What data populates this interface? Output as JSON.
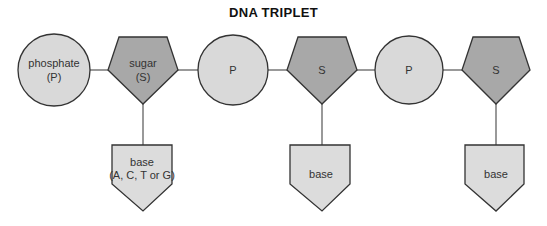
{
  "title": "DNA TRIPLET",
  "colors": {
    "phosphate_fill": "#d9d9d9",
    "sugar_fill": "#a8a8a8",
    "base_fill": "#dcdcdc",
    "stroke": "#333333",
    "connector": "#555555"
  },
  "nodes": [
    {
      "type": "phosphate",
      "line1": "phosphate",
      "line2": "(P)"
    },
    {
      "type": "sugar",
      "line1": "sugar",
      "line2": "(S)"
    },
    {
      "type": "phosphate",
      "line1": "P",
      "line2": ""
    },
    {
      "type": "sugar",
      "line1": "S",
      "line2": ""
    },
    {
      "type": "phosphate",
      "line1": "P",
      "line2": ""
    },
    {
      "type": "sugar",
      "line1": "S",
      "line2": ""
    }
  ],
  "bases": [
    {
      "line1": "base",
      "line2": "(A, C, T or G)"
    },
    {
      "line1": "base",
      "line2": ""
    },
    {
      "line1": "base",
      "line2": ""
    }
  ]
}
